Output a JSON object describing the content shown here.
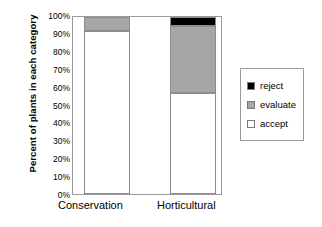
{
  "chart_data": {
    "type": "bar",
    "stacked": true,
    "title": "",
    "xlabel": "",
    "ylabel": "Percent of plants in each category",
    "categories": [
      "Conservation",
      "Horticultural"
    ],
    "series": [
      {
        "name": "reject",
        "color": "#000000",
        "values": [
          0,
          5
        ]
      },
      {
        "name": "evaluate",
        "color": "#a6a6a6",
        "values": [
          8,
          38
        ]
      },
      {
        "name": "accept",
        "color": "#ffffff",
        "values": [
          92,
          57
        ]
      }
    ],
    "ylim": [
      0,
      100
    ],
    "ytick_labels": [
      "0%",
      "10%",
      "20%",
      "30%",
      "40%",
      "50%",
      "60%",
      "70%",
      "80%",
      "90%",
      "100%"
    ],
    "ytick_values": [
      0,
      10,
      20,
      30,
      40,
      50,
      60,
      70,
      80,
      90,
      100
    ],
    "grid": false,
    "legend_position": "right"
  },
  "legend": {
    "items": [
      {
        "label": "reject",
        "color": "#000000"
      },
      {
        "label": "evaluate",
        "color": "#a6a6a6"
      },
      {
        "label": "accept",
        "color": "#ffffff"
      }
    ]
  }
}
